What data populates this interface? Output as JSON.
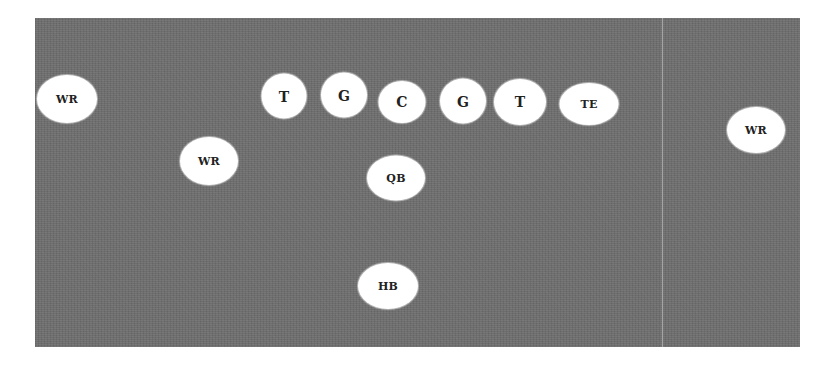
{
  "diagram": {
    "type": "football-offensive-formation",
    "colors": {
      "field": "#6d6d6d",
      "divider": "#a4a4a4",
      "player_fill": "#ffffff",
      "label_text": "#222222",
      "background": "#ffffff"
    },
    "field": {
      "x": 35,
      "y": 18,
      "width": 765,
      "height": 329
    },
    "divider": {
      "x": 662
    },
    "players": [
      {
        "id": "wr-left-wide",
        "label": "WR",
        "cx": 67,
        "cy": 99,
        "w": 60,
        "h": 48
      },
      {
        "id": "wr-slot",
        "label": "WR",
        "cx": 209,
        "cy": 161,
        "w": 58,
        "h": 48
      },
      {
        "id": "lt",
        "label": "T",
        "cx": 284,
        "cy": 96,
        "w": 45,
        "h": 45
      },
      {
        "id": "lg",
        "label": "G",
        "cx": 344,
        "cy": 95,
        "w": 46,
        "h": 45
      },
      {
        "id": "c",
        "label": "C",
        "cx": 402,
        "cy": 102,
        "w": 47,
        "h": 42
      },
      {
        "id": "rg",
        "label": "G",
        "cx": 463,
        "cy": 101,
        "w": 46,
        "h": 45
      },
      {
        "id": "rt",
        "label": "T",
        "cx": 520,
        "cy": 102,
        "w": 52,
        "h": 46
      },
      {
        "id": "te",
        "label": "TE",
        "cx": 589,
        "cy": 104,
        "w": 59,
        "h": 42
      },
      {
        "id": "qb",
        "label": "QB",
        "cx": 396,
        "cy": 178,
        "w": 58,
        "h": 45
      },
      {
        "id": "hb",
        "label": "HB",
        "cx": 388,
        "cy": 286,
        "w": 60,
        "h": 46
      },
      {
        "id": "wr-right-wide",
        "label": "WR",
        "cx": 756,
        "cy": 130,
        "w": 58,
        "h": 46
      }
    ]
  }
}
